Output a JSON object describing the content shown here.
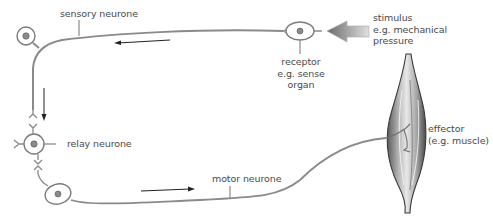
{
  "diagram": {
    "type": "reflex-arc",
    "labels": {
      "sensory_neurone": "sensory neurone",
      "stimulus_line1": "stimulus",
      "stimulus_line2": "e.g. mechanical",
      "stimulus_line3": "pressure",
      "receptor_line1": "receptor",
      "receptor_line2": "e.g. sense",
      "receptor_line3": "organ",
      "relay_neurone": "relay neurone",
      "motor_neurone": "motor neurone",
      "effector_line1": "effector",
      "effector_line2": "(e.g. muscle)"
    },
    "colors": {
      "nerve": "#8a8a8a",
      "text": "#4a4a4a",
      "nucleus": "#7a7a7a",
      "arrow": "#222222"
    },
    "flow": [
      "stimulus",
      "receptor",
      "sensory neurone",
      "relay neurone",
      "motor neurone",
      "effector"
    ]
  }
}
